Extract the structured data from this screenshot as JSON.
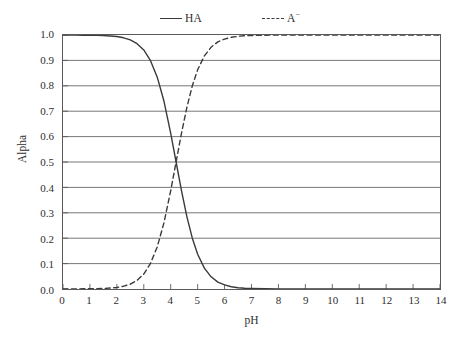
{
  "chart_data": {
    "type": "line",
    "title": "",
    "xlabel": "pH",
    "ylabel": "Alpha",
    "xlim": [
      0,
      14
    ],
    "ylim": [
      0,
      1.0
    ],
    "grid": "horizontal",
    "legend_position": "top-center",
    "xticks": [
      "0",
      "1",
      "2",
      "3",
      "4",
      "5",
      "6",
      "7",
      "8",
      "9",
      "10",
      "11",
      "12",
      "13",
      "14"
    ],
    "yticks": [
      "0.0",
      "0.1",
      "0.2",
      "0.3",
      "0.4",
      "0.5",
      "0.6",
      "0.7",
      "0.8",
      "0.9",
      "1.0"
    ],
    "pKa": 4.2,
    "x": [
      0,
      0.25,
      0.5,
      0.75,
      1,
      1.25,
      1.5,
      1.75,
      2,
      2.25,
      2.5,
      2.75,
      3,
      3.25,
      3.5,
      3.75,
      4,
      4.2,
      4.4,
      4.6,
      4.8,
      5,
      5.25,
      5.5,
      5.75,
      6,
      6.25,
      6.5,
      6.75,
      7,
      7.5,
      8,
      8.5,
      9,
      9.5,
      10,
      10.5,
      11,
      11.5,
      12,
      12.5,
      13,
      13.5,
      14
    ],
    "series": [
      {
        "name": "HA",
        "style": "solid",
        "color": "#3a3a3a",
        "values": [
          1.0,
          1.0,
          1.0,
          0.999,
          0.999,
          0.999,
          0.998,
          0.996,
          0.994,
          0.989,
          0.981,
          0.966,
          0.941,
          0.899,
          0.834,
          0.739,
          0.613,
          0.5,
          0.387,
          0.285,
          0.201,
          0.137,
          0.082,
          0.048,
          0.027,
          0.016,
          0.009,
          0.005,
          0.003,
          0.002,
          0.001,
          0.0,
          0.0,
          0.0,
          0.0,
          0.0,
          0.0,
          0.0,
          0.0,
          0.0,
          0.0,
          0.0,
          0.0,
          0.0
        ]
      },
      {
        "name": "A−",
        "style": "dashed",
        "color": "#3a3a3a",
        "values": [
          0.0,
          0.0,
          0.0,
          0.001,
          0.001,
          0.001,
          0.002,
          0.004,
          0.006,
          0.011,
          0.019,
          0.034,
          0.059,
          0.101,
          0.166,
          0.261,
          0.387,
          0.5,
          0.613,
          0.715,
          0.799,
          0.863,
          0.918,
          0.952,
          0.973,
          0.984,
          0.991,
          0.995,
          0.997,
          0.998,
          0.999,
          1.0,
          1.0,
          1.0,
          1.0,
          1.0,
          1.0,
          1.0,
          1.0,
          1.0,
          1.0,
          1.0,
          1.0,
          1.0
        ]
      }
    ]
  },
  "legend": {
    "items": [
      {
        "label": "HA",
        "sup": "",
        "style": "solid"
      },
      {
        "label": "A",
        "sup": "−",
        "style": "dashed"
      }
    ]
  },
  "axes": {
    "x_title": "pH",
    "y_title": "Alpha"
  }
}
